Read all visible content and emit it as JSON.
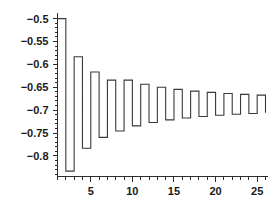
{
  "chart_data": {
    "type": "line",
    "title": "",
    "subtitle": "",
    "xlabel": "",
    "ylabel": "",
    "style": "step",
    "grid": false,
    "legend": null,
    "xlim": [
      1,
      26
    ],
    "ylim": [
      -0.845,
      -0.49
    ],
    "x": [
      1,
      2,
      3,
      4,
      5,
      6,
      7,
      8,
      9,
      10,
      11,
      12,
      13,
      14,
      15,
      16,
      17,
      18,
      19,
      20,
      21,
      22,
      23,
      24,
      25,
      26
    ],
    "values": [
      -0.5,
      -0.8333,
      -0.5833,
      -0.7833,
      -0.6167,
      -0.7595,
      -0.6345,
      -0.7456,
      -0.6345,
      -0.7345,
      -0.6436,
      -0.7269,
      -0.65,
      -0.7214,
      -0.6547,
      -0.7172,
      -0.6584,
      -0.714,
      -0.6613,
      -0.7113,
      -0.6637,
      -0.7091,
      -0.6656,
      -0.7073,
      -0.6673,
      -0.7058
    ],
    "series": [
      {
        "name": "partial sums",
        "values": [
          -0.5,
          -0.8333,
          -0.5833,
          -0.7833,
          -0.6167,
          -0.7595,
          -0.6345,
          -0.7456,
          -0.6345,
          -0.7345,
          -0.6436,
          -0.7269,
          -0.65,
          -0.7214,
          -0.6547,
          -0.7172,
          -0.6584,
          -0.714,
          -0.6613,
          -0.7113,
          -0.6637,
          -0.7091,
          -0.6656,
          -0.7073,
          -0.6673,
          -0.7058
        ]
      }
    ],
    "yticks": [
      -0.5,
      -0.55,
      -0.6,
      -0.65,
      -0.7,
      -0.75,
      -0.8
    ],
    "ytick_labels": [
      "−0.5",
      "−0.55",
      "−0.6",
      "−0.65",
      "−0.7",
      "−0.75",
      "−0.8"
    ],
    "xticks": [
      5,
      10,
      15,
      20,
      25
    ],
    "xtick_labels": [
      "5",
      "10",
      "15",
      "20",
      "25"
    ],
    "x_minor_ticks": [
      1,
      2,
      3,
      4,
      5,
      6,
      7,
      8,
      9,
      10,
      11,
      12,
      13,
      14,
      15,
      16,
      17,
      18,
      19,
      20,
      21,
      22,
      23,
      24,
      25,
      26
    ],
    "y_minor_step": 0.01,
    "line_color": "#3a3a3a",
    "axis_color": "#2b2b2b",
    "background_color": "#ffffff"
  }
}
